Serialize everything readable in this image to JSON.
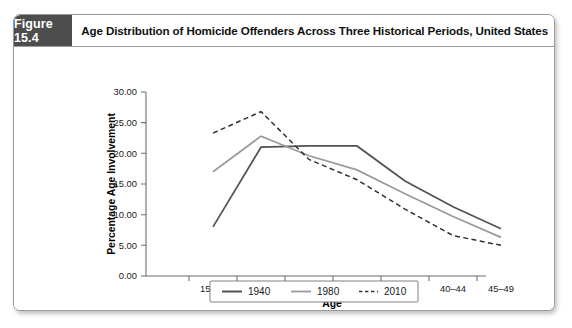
{
  "figure": {
    "number_label": "Figure 15.4",
    "title": "Age Distribution of Homicide Offenders Across Three Historical Periods, United States"
  },
  "chart_data": {
    "type": "line",
    "title": "Age Distribution of Homicide Offenders Across Three Historical Periods, United States",
    "xlabel": "Age",
    "ylabel": "Percentage Age Involvement",
    "categories": [
      "15–19",
      "20–24",
      "25–29",
      "30–34",
      "35–39",
      "40–44",
      "45–49"
    ],
    "ylim": [
      0,
      30
    ],
    "ytick_step": 5,
    "ytick_labels": [
      "0.00",
      "5.00",
      "10.00",
      "15.00",
      "20.00",
      "25.00",
      "30.00"
    ],
    "grid": false,
    "legend_position": "bottom-center",
    "series": [
      {
        "name": "1940",
        "style": "solid",
        "color": "#525252",
        "values": [
          8.0,
          21.0,
          21.2,
          21.2,
          15.5,
          11.3,
          7.7
        ]
      },
      {
        "name": "1980",
        "style": "solid",
        "color": "#9a9a9a",
        "values": [
          17.0,
          22.8,
          19.6,
          17.3,
          13.4,
          9.7,
          6.3
        ]
      },
      {
        "name": "2010",
        "style": "dashed",
        "color": "#303030",
        "values": [
          23.3,
          26.8,
          19.0,
          15.7,
          10.9,
          6.6,
          5.0
        ]
      }
    ]
  },
  "legend": {
    "items": [
      {
        "label": "1940",
        "style": "solid-dark"
      },
      {
        "label": "1980",
        "style": "solid-light"
      },
      {
        "label": "2010",
        "style": "dashed"
      }
    ]
  },
  "colors": {
    "header_badge_bg": "#4d4d4d",
    "header_badge_text": "#ffffff",
    "card_border": "#9a9a9a",
    "axis": "#6e6e6e",
    "series_1940": "#525252",
    "series_1980": "#9a9a9a",
    "series_2010": "#303030"
  }
}
